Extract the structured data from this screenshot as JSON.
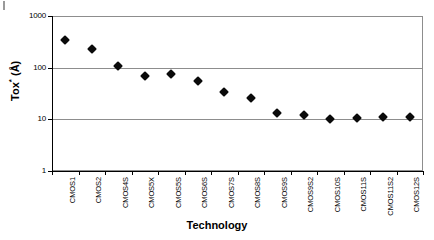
{
  "chart_data": {
    "type": "scatter",
    "title": "",
    "xlabel": "Technology",
    "ylabel": "Tox* (Å)",
    "ylabel_base": "Tox",
    "ylabel_sup": "*",
    "ylabel_unit": "(Å)",
    "yscale": "log",
    "ylim": [
      1,
      1000
    ],
    "ytick_labels": [
      "1000",
      "100",
      "10",
      "1"
    ],
    "ytick_values": [
      1000,
      100,
      10,
      1
    ],
    "grid": "horizontal",
    "legend": "none",
    "marker": "filled-diamond",
    "marker_color": "#0a0a0a",
    "categories": [
      "CMOS1",
      "CMOS2",
      "CMOS4S",
      "CMOS5X",
      "CMOS5S",
      "CMOS6S",
      "CMOS7S",
      "CMOS8S",
      "CMOS9S",
      "CMOS9S2",
      "CMOS10S",
      "CMOS11S",
      "CMOS11S2",
      "CMOS12S"
    ],
    "values": [
      345,
      225,
      110,
      68,
      77,
      54,
      34,
      26,
      13.5,
      12,
      10,
      10.5,
      11,
      11
    ]
  }
}
